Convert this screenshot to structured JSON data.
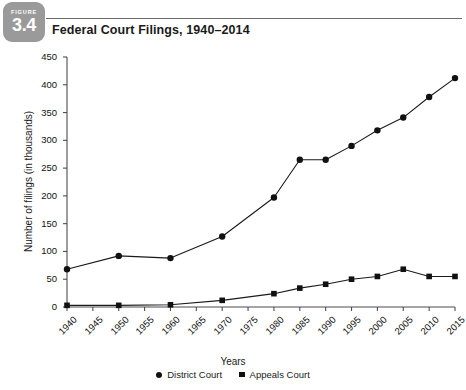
{
  "figure": {
    "kicker": "FIGURE",
    "number": "3.4",
    "title": "Federal Court Filings, 1940–2014",
    "badge_color": "#9a9a9a"
  },
  "legend": {
    "position": "bottom-center",
    "entries": [
      {
        "label": "District Court",
        "marker": "circle-marker",
        "color": "#111111"
      },
      {
        "label": "Appeals Court",
        "marker": "square-marker",
        "color": "#111111"
      }
    ]
  },
  "chart_data": {
    "type": "line",
    "title": "Federal Court Filings, 1940–2014",
    "xlabel": "Years",
    "ylabel": "Number of filings (in thousands)",
    "xlim": [
      1940,
      2015
    ],
    "ylim": [
      0,
      450
    ],
    "ytick_step": 50,
    "xtick_step": 5,
    "grid": false,
    "legend_position": "bottom-center",
    "xticks": [
      "1940",
      "1945",
      "1950",
      "1955",
      "1960",
      "1965",
      "1970",
      "1975",
      "1980",
      "1985",
      "1990",
      "1995",
      "2000",
      "2005",
      "2010",
      "2015"
    ],
    "yticks": [
      "0",
      "50",
      "100",
      "150",
      "200",
      "250",
      "300",
      "350",
      "400",
      "450"
    ],
    "series": [
      {
        "name": "District Court",
        "marker": "circle",
        "x": [
          1940,
          1950,
          1960,
          1970,
          1980,
          1985,
          1990,
          1995,
          2000,
          2005,
          2010,
          2015
        ],
        "values": [
          68,
          92,
          88,
          127,
          197,
          265,
          265,
          290,
          318,
          341,
          378,
          412
        ]
      },
      {
        "name": "Appeals Court",
        "marker": "square",
        "x": [
          1940,
          1950,
          1960,
          1970,
          1980,
          1985,
          1990,
          1995,
          2000,
          2005,
          2010,
          2015
        ],
        "values": [
          3,
          3,
          4,
          12,
          24,
          34,
          41,
          50,
          55,
          68,
          55,
          55
        ]
      }
    ]
  }
}
